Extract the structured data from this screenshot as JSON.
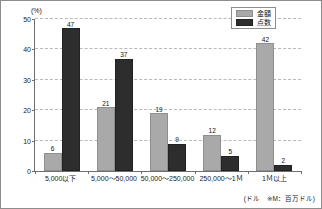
{
  "chart_data": {
    "type": "bar",
    "title": "",
    "subtitle": "",
    "xlabel": "",
    "ylabel": "(%)",
    "ylim": [
      0,
      50
    ],
    "yticks": [
      0,
      10,
      20,
      30,
      40,
      50
    ],
    "grid": true,
    "legend_position": "top-right",
    "categories": [
      "5,000以下",
      "5,000～50,000",
      "50,000～250,000",
      "250,000～1Ｍ",
      "1Ｍ以上"
    ],
    "series": [
      {
        "name": "金額",
        "color": "#a9a9a9",
        "values": [
          6,
          21,
          19,
          12,
          42
        ]
      },
      {
        "name": "点数",
        "color": "#2d2d2d",
        "values": [
          47,
          37,
          9,
          5,
          2
        ]
      }
    ],
    "annotations": [
      "(ドル　※M：百万ドル)"
    ]
  },
  "axis": {
    "unit_label": "(%)",
    "tick_0": "0",
    "tick_10": "10",
    "tick_20": "20",
    "tick_30": "30",
    "tick_40": "40",
    "tick_50": "50"
  },
  "legend": {
    "items": [
      {
        "label": "金額"
      },
      {
        "label": "点数"
      }
    ]
  },
  "footnote": {
    "text": "(ドル　※M：百万ドル)"
  }
}
